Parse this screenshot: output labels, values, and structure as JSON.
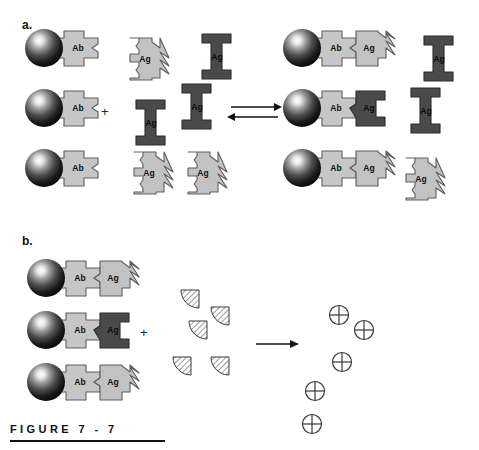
{
  "figure": {
    "caption_label": "FIGURE  7 - 7",
    "panels": [
      {
        "id": "a",
        "label": "a."
      },
      {
        "id": "b",
        "label": "b."
      }
    ]
  },
  "colors": {
    "antibody_light_gray": "#c6c6c6",
    "antigen_light_gray": "#c2c2c2",
    "antigen_dark_gray": "#4a4a4a",
    "bead_black": "#111111",
    "bead_highlight": "#ffffff",
    "outline": "#5a5a5a",
    "ink": "#111111",
    "background": "#ffffff"
  },
  "labels": {
    "antibody": "Ab",
    "antigen": "Ag",
    "plus": "+"
  },
  "panel_a": {
    "label": "a.",
    "plus_sign": "+",
    "reaction_arrow": "equilibrium-double-arrow",
    "left_side": {
      "beads": [
        {
          "index": 1,
          "bead_label": "Ab",
          "state": "free-antibody"
        },
        {
          "index": 2,
          "bead_label": "Ab",
          "state": "free-antibody"
        },
        {
          "index": 3,
          "bead_label": "Ab",
          "state": "free-antibody"
        }
      ],
      "free_antigens": [
        {
          "index": 1,
          "label": "Ag",
          "type": "matching",
          "shade": "light"
        },
        {
          "index": 2,
          "label": "Ag",
          "type": "non-matching",
          "shade": "dark"
        },
        {
          "index": 3,
          "label": "Ag",
          "type": "non-matching",
          "shade": "dark"
        },
        {
          "index": 4,
          "label": "Ag",
          "type": "non-matching",
          "shade": "dark"
        },
        {
          "index": 5,
          "label": "Ag",
          "type": "matching",
          "shade": "light"
        },
        {
          "index": 6,
          "label": "Ag",
          "type": "matching",
          "shade": "light"
        }
      ]
    },
    "right_side": {
      "complexes": [
        {
          "index": 1,
          "bead_label": "Ab",
          "bound_label": "Ag",
          "bound_shade": "light"
        },
        {
          "index": 2,
          "bead_label": "Ab",
          "bound_label": "Ag",
          "bound_shade": "dark"
        },
        {
          "index": 3,
          "bead_label": "Ab",
          "bound_label": "Ag",
          "bound_shade": "light"
        }
      ],
      "unbound_antigens": [
        {
          "index": 1,
          "label": "Ag",
          "type": "non-matching",
          "shade": "dark"
        },
        {
          "index": 2,
          "label": "Ag",
          "type": "non-matching",
          "shade": "dark"
        },
        {
          "index": 3,
          "label": "Ag",
          "type": "matching",
          "shade": "light"
        }
      ]
    }
  },
  "panel_b": {
    "label": "b.",
    "plus_sign": "+",
    "reaction_arrow": "single-right-arrow",
    "complexes": [
      {
        "index": 1,
        "bead_label": "Ab",
        "bound_label": "Ag",
        "bound_shade": "light"
      },
      {
        "index": 2,
        "bead_label": "Ab",
        "bound_label": "Ag",
        "bound_shade": "dark"
      },
      {
        "index": 3,
        "bead_label": "Ab",
        "bound_label": "Ag",
        "bound_shade": "light"
      }
    ],
    "reagent_wedges": [
      {
        "index": 1
      },
      {
        "index": 2
      },
      {
        "index": 3
      },
      {
        "index": 4
      },
      {
        "index": 5
      }
    ],
    "product_symbols": [
      {
        "index": 1,
        "glyph": "circled-cross"
      },
      {
        "index": 2,
        "glyph": "circled-cross"
      },
      {
        "index": 3,
        "glyph": "circled-cross"
      },
      {
        "index": 4,
        "glyph": "circled-cross"
      },
      {
        "index": 5,
        "glyph": "circled-cross"
      }
    ]
  }
}
